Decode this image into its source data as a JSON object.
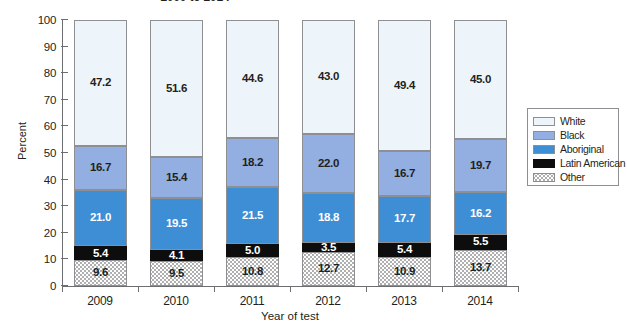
{
  "chart_data": {
    "type": "bar",
    "stacked": true,
    "stack_mode": "percent",
    "title": "2009 to 2014",
    "xlabel": "Year of test",
    "ylabel": "Percent",
    "ylim": [
      0,
      100
    ],
    "yticks": [
      0,
      10,
      20,
      30,
      40,
      50,
      60,
      70,
      80,
      90,
      100
    ],
    "grid": false,
    "legend_position": "right",
    "categories": [
      "2009",
      "2010",
      "2011",
      "2012",
      "2013",
      "2014"
    ],
    "series": [
      {
        "name": "Other",
        "color": "#fdfdfd",
        "pattern": "dotted",
        "label_color": "#231f20",
        "values": [
          9.6,
          9.5,
          10.8,
          12.7,
          10.9,
          13.7
        ],
        "labels": [
          "9.6",
          "9.5",
          "10.8",
          "12.7",
          "10.9",
          "13.7"
        ]
      },
      {
        "name": "Latin American",
        "color": "#0d0d0d",
        "label_color": "#ffffff",
        "values": [
          5.4,
          4.1,
          5.0,
          3.5,
          5.4,
          5.5
        ],
        "labels": [
          "5.4",
          "4.1",
          "5.0",
          "3.5",
          "5.4",
          "5.5"
        ]
      },
      {
        "name": "Aboriginal",
        "color": "#3d8ed4",
        "label_color": "#ffffff",
        "values": [
          21.0,
          19.5,
          21.5,
          18.8,
          17.7,
          16.2
        ],
        "labels": [
          "21.0",
          "19.5",
          "21.5",
          "18.8",
          "17.7",
          "16.2"
        ]
      },
      {
        "name": "Black",
        "color": "#93aee0",
        "label_color": "#231f20",
        "values": [
          16.7,
          15.4,
          18.2,
          22.0,
          16.7,
          19.7
        ],
        "labels": [
          "16.7",
          "15.4",
          "18.2",
          "22.0",
          "16.7",
          "19.7"
        ]
      },
      {
        "name": "White",
        "color": "#eef5fa",
        "label_color": "#231f20",
        "values": [
          47.2,
          51.6,
          44.6,
          43.0,
          49.4,
          45.0
        ],
        "labels": [
          "47.2",
          "51.6",
          "44.6",
          "43.0",
          "49.4",
          "45.0"
        ]
      }
    ],
    "legend": [
      {
        "label": "White",
        "key": "cat-white"
      },
      {
        "label": "Black",
        "key": "cat-black"
      },
      {
        "label": "Aboriginal",
        "key": "cat-abor"
      },
      {
        "label": "Latin American",
        "key": "cat-latin"
      },
      {
        "label": "Other",
        "key": "cat-other"
      }
    ]
  }
}
